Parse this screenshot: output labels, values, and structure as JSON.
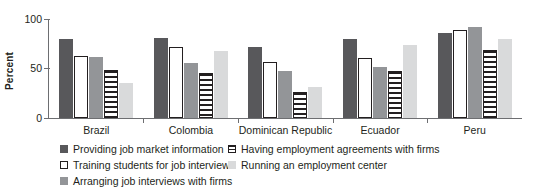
{
  "chart_data": {
    "type": "bar",
    "title": "",
    "xlabel": "",
    "ylabel": "Percent",
    "ylim": [
      0,
      100
    ],
    "yticks": [
      "0",
      "50",
      "100"
    ],
    "grid": false,
    "legend_position": "bottom",
    "categories": [
      "Brazil",
      "Colombia",
      "Dominican Republic",
      "Ecuador",
      "Peru"
    ],
    "series": [
      {
        "name": "Providing job market information",
        "color": "#58585b",
        "pattern": "solid-dark",
        "values": [
          80,
          81,
          72,
          80,
          86
        ]
      },
      {
        "name": "Training students for job interviews",
        "color": "#ffffff",
        "pattern": "outlined-white",
        "values": [
          63,
          72,
          57,
          61,
          89
        ]
      },
      {
        "name": "Arranging job interviews with firms",
        "color": "#939598",
        "pattern": "solid-mid-gray",
        "values": [
          62,
          56,
          48,
          52,
          92
        ]
      },
      {
        "name": "Having employment agreements with firms",
        "color": "#231f20",
        "pattern": "horizontal-stripes",
        "values": [
          49,
          46,
          26,
          48,
          69
        ]
      },
      {
        "name": "Running an employment center",
        "color": "#d9dadb",
        "pattern": "solid-light-gray",
        "values": [
          35,
          68,
          31,
          74,
          80
        ]
      }
    ]
  },
  "legend": {
    "items": [
      {
        "label": "Providing job market information",
        "swatch": "solid-dark-swatch"
      },
      {
        "label": "Having employment agreements with firms",
        "swatch": "striped-swatch"
      },
      {
        "label": "Training students for job interviews",
        "swatch": "outlined-white-swatch"
      },
      {
        "label": "Running an employment center",
        "swatch": "light-gray-swatch"
      },
      {
        "label": "Arranging job interviews with firms",
        "swatch": "mid-gray-swatch"
      }
    ]
  }
}
